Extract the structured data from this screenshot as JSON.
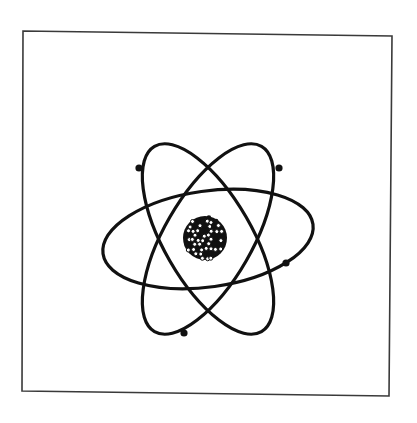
{
  "figure": {
    "style": "black line art on white, framed",
    "colors": {
      "ink": "#111111",
      "frame": "#3a3a3a",
      "background": "#ffffff"
    }
  },
  "atom": {
    "orbit_count": 3,
    "orbit_orientations_deg": [
      -8,
      60,
      -60
    ],
    "electron_count": 4,
    "nucleus": {
      "appearance": "cluster of dark and light spherical nucleons"
    }
  }
}
